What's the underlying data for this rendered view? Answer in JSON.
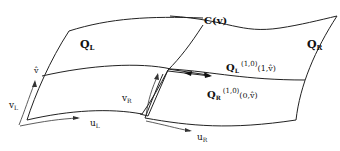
{
  "diagram": {
    "patches": {
      "left": {
        "label": "Q",
        "sub": "L"
      },
      "right": {
        "label": "Q",
        "sub": "R"
      }
    },
    "boundary_curve": {
      "label": "C(v)"
    },
    "left_params": {
      "u": "u",
      "u_sub": "L",
      "v": "v",
      "v_sub": "L",
      "vhat": "v̂"
    },
    "right_params": {
      "u": "u",
      "u_sub": "R",
      "v": "v",
      "v_sub": "R"
    },
    "derivative_left": {
      "base": "Q",
      "sub": "L",
      "sup": "(1,0)",
      "arg": "(1,v̂)"
    },
    "derivative_right": {
      "base": "Q",
      "sub": "R",
      "sup": "(1,0)",
      "arg": "(0,v̂)"
    }
  }
}
